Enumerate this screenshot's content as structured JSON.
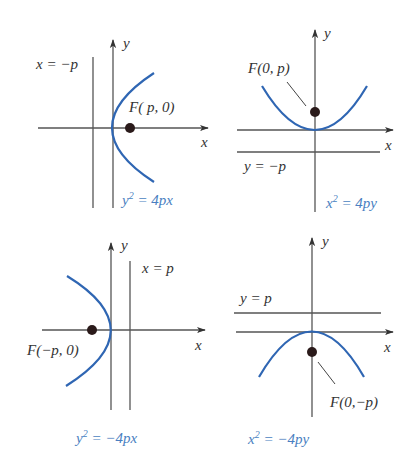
{
  "figure": {
    "colors": {
      "curve": "#2f66b3",
      "equation_text": "#4a7fc1",
      "axes": "#555555",
      "text": "#333333",
      "focus_dot": "#2a1a1a"
    },
    "panels": [
      {
        "id": "a",
        "opens": "right",
        "equation": "y² = 4px",
        "equation_base": "y",
        "equation_sup": "2",
        "equation_rest": " = 4px",
        "focus_label": "F( p, 0)",
        "directrix_label": "x = −p",
        "axis_x_label": "x",
        "axis_y_label": "y"
      },
      {
        "id": "b",
        "opens": "up",
        "equation": "x² = 4py",
        "equation_base": "x",
        "equation_sup": "2",
        "equation_rest": " = 4py",
        "focus_label": "F(0, p)",
        "directrix_label": "y = −p",
        "axis_x_label": "x",
        "axis_y_label": "y"
      },
      {
        "id": "c",
        "opens": "left",
        "equation": "y² = −4px",
        "equation_base": "y",
        "equation_sup": "2",
        "equation_rest": " = −4px",
        "focus_label": "F(−p, 0)",
        "directrix_label": "x = p",
        "axis_x_label": "x",
        "axis_y_label": "y"
      },
      {
        "id": "d",
        "opens": "down",
        "equation": "x² = −4py",
        "equation_base": "x",
        "equation_sup": "2",
        "equation_rest": " = −4py",
        "focus_label": "F(0,−p)",
        "directrix_label": "y = p",
        "axis_x_label": "x",
        "axis_y_label": "y"
      }
    ]
  }
}
